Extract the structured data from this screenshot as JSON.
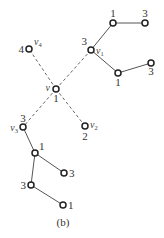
{
  "caption": "(b)",
  "nodes": [
    {
      "id": "v",
      "name": "v",
      "sub": "",
      "value": "1"
    },
    {
      "id": "v1",
      "name": "v",
      "sub": "1",
      "value": "3"
    },
    {
      "id": "v2",
      "name": "v",
      "sub": "2",
      "value": "2"
    },
    {
      "id": "v3",
      "name": "v",
      "sub": "3",
      "value": "3"
    },
    {
      "id": "v4",
      "name": "v",
      "sub": "4",
      "value": "4"
    },
    {
      "id": "a1",
      "name": "",
      "sub": "",
      "value": "1"
    },
    {
      "id": "a2",
      "name": "",
      "sub": "",
      "value": "3"
    },
    {
      "id": "b1",
      "name": "",
      "sub": "",
      "value": "1"
    },
    {
      "id": "b2",
      "name": "",
      "sub": "",
      "value": "3"
    },
    {
      "id": "c1",
      "name": "",
      "sub": "",
      "value": "1"
    },
    {
      "id": "c2",
      "name": "",
      "sub": "",
      "value": "3"
    },
    {
      "id": "c3",
      "name": "",
      "sub": "",
      "value": "3"
    },
    {
      "id": "c4",
      "name": "",
      "sub": "",
      "value": "1"
    }
  ],
  "edges": [
    {
      "from": "v",
      "to": "v1",
      "style": "dashed"
    },
    {
      "from": "v",
      "to": "v2",
      "style": "dashed"
    },
    {
      "from": "v",
      "to": "v3",
      "style": "dashed"
    },
    {
      "from": "v",
      "to": "v4",
      "style": "dashed"
    },
    {
      "from": "v1",
      "to": "a1",
      "style": "solid"
    },
    {
      "from": "a1",
      "to": "a2",
      "style": "solid"
    },
    {
      "from": "v1",
      "to": "b1",
      "style": "solid"
    },
    {
      "from": "b1",
      "to": "b2",
      "style": "solid"
    },
    {
      "from": "v3",
      "to": "c1",
      "style": "solid"
    },
    {
      "from": "c1",
      "to": "c2",
      "style": "solid"
    },
    {
      "from": "c1",
      "to": "c3",
      "style": "solid"
    },
    {
      "from": "c3",
      "to": "c4",
      "style": "solid"
    }
  ]
}
